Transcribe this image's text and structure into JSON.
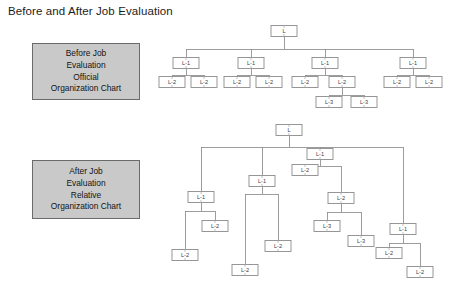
{
  "title": "Before and After Job Evaluation",
  "colors": {
    "caption_fill": "#c9c9c9",
    "caption_border": "#6b6b6b",
    "node_fill": "#ffffff",
    "node_border": "#8c8c8c",
    "edge": "#8c8c8c",
    "background": "#ffffff",
    "text": "#1a1a1a"
  },
  "captions": {
    "before": {
      "lines": [
        "Before Job",
        "Evaluation",
        "Official",
        "Organization Chart"
      ]
    },
    "after": {
      "lines": [
        "After Job",
        "Evaluation",
        "Relative",
        "Organization Chart"
      ]
    }
  },
  "chart_data": {
    "type": "diagram",
    "subtype": "organization-chart-pair",
    "title": "Before and After Job Evaluation",
    "node_size": {
      "width": 26,
      "height": 11
    },
    "level_labels": [
      "L",
      "L-1",
      "L-2",
      "L-3"
    ],
    "charts": [
      {
        "name": "before-job-evaluation-official-organization-chart",
        "caption": [
          "Before Job",
          "Evaluation",
          "Official",
          "Organization Chart"
        ],
        "description": "Official chart: levels are drawn at uniform depths, all L-1 aligned, all L-2 aligned.",
        "counts": {
          "L": 1,
          "L-1": 4,
          "L-2": 8,
          "L-3": 2,
          "total": 15
        },
        "nodes": [
          {
            "id": "b-root",
            "label": "L",
            "cx": 284,
            "cy": 31
          },
          {
            "id": "b1",
            "label": "L-1",
            "cx": 186,
            "cy": 63
          },
          {
            "id": "b2",
            "label": "L-1",
            "cx": 251,
            "cy": 63
          },
          {
            "id": "b3",
            "label": "L-1",
            "cx": 325,
            "cy": 63
          },
          {
            "id": "b4",
            "label": "L-1",
            "cx": 413,
            "cy": 63
          },
          {
            "id": "b1a",
            "label": "L-2",
            "cx": 172,
            "cy": 82
          },
          {
            "id": "b1b",
            "label": "L-2",
            "cx": 204,
            "cy": 82
          },
          {
            "id": "b2a",
            "label": "L-2",
            "cx": 237,
            "cy": 82
          },
          {
            "id": "b2b",
            "label": "L-2",
            "cx": 269,
            "cy": 82
          },
          {
            "id": "b3a",
            "label": "L-2",
            "cx": 305,
            "cy": 82
          },
          {
            "id": "b3b",
            "label": "L-2",
            "cx": 342,
            "cy": 82
          },
          {
            "id": "b4a",
            "label": "L-2",
            "cx": 397,
            "cy": 82
          },
          {
            "id": "b4b",
            "label": "L-2",
            "cx": 429,
            "cy": 82
          },
          {
            "id": "b3b1",
            "label": "L-3",
            "cx": 329,
            "cy": 102
          },
          {
            "id": "b3b2",
            "label": "L-3",
            "cx": 364,
            "cy": 102
          }
        ],
        "edges": [
          {
            "parent": "b-root",
            "children": [
              "b1",
              "b2",
              "b3",
              "b4"
            ],
            "bus_y": 49
          },
          {
            "parent": "b1",
            "children": [
              "b1a",
              "b1b"
            ],
            "bus_y": 75
          },
          {
            "parent": "b2",
            "children": [
              "b2a",
              "b2b"
            ],
            "bus_y": 75
          },
          {
            "parent": "b3",
            "children": [
              "b3a",
              "b3b"
            ],
            "bus_y": 75
          },
          {
            "parent": "b4",
            "children": [
              "b4a",
              "b4b"
            ],
            "bus_y": 75
          },
          {
            "parent": "b3b",
            "children": [
              "b3b1",
              "b3b2"
            ],
            "bus_y": 95
          }
        ]
      },
      {
        "name": "after-job-evaluation-relative-organization-chart",
        "caption": [
          "After Job",
          "Evaluation",
          "Relative",
          "Organization Chart"
        ],
        "description": "Relative chart: same hierarchy but each node is placed at a depth reflecting its evaluated job size, so siblings sit at staggered heights.",
        "counts": {
          "L": 1,
          "L-1": 4,
          "L-2": 8,
          "L-3": 2,
          "total": 15
        },
        "nodes": [
          {
            "id": "a-root",
            "label": "L",
            "cx": 289,
            "cy": 130
          },
          {
            "id": "a1",
            "label": "L-1",
            "cx": 201,
            "cy": 197
          },
          {
            "id": "a2",
            "label": "L-1",
            "cx": 262,
            "cy": 181
          },
          {
            "id": "a3",
            "label": "L-1",
            "cx": 320,
            "cy": 154
          },
          {
            "id": "a4",
            "label": "L-1",
            "cx": 403,
            "cy": 229
          },
          {
            "id": "a1a",
            "label": "L-2",
            "cx": 185,
            "cy": 255
          },
          {
            "id": "a1b",
            "label": "L-2",
            "cx": 215,
            "cy": 226
          },
          {
            "id": "a2a",
            "label": "L-2",
            "cx": 245,
            "cy": 270
          },
          {
            "id": "a2b",
            "label": "L-2",
            "cx": 278,
            "cy": 246
          },
          {
            "id": "a3a",
            "label": "L-2",
            "cx": 305,
            "cy": 170
          },
          {
            "id": "a3b",
            "label": "L-2",
            "cx": 341,
            "cy": 198
          },
          {
            "id": "a4a",
            "label": "L-2",
            "cx": 389,
            "cy": 253
          },
          {
            "id": "a4b",
            "label": "L-2",
            "cx": 420,
            "cy": 272
          },
          {
            "id": "a3b1",
            "label": "L-3",
            "cx": 327,
            "cy": 226
          },
          {
            "id": "a3b2",
            "label": "L-3",
            "cx": 361,
            "cy": 241
          }
        ],
        "edges": [
          {
            "parent": "a-root",
            "children": [
              "a1",
              "a2",
              "a3",
              "a4"
            ],
            "bus_y": 147
          },
          {
            "parent": "a1",
            "children": [
              "a1a",
              "a1b"
            ],
            "bus_y": 211
          },
          {
            "parent": "a2",
            "children": [
              "a2a",
              "a2b"
            ],
            "bus_y": 194
          },
          {
            "parent": "a3",
            "children": [
              "a3a",
              "a3b"
            ],
            "bus_y": 166
          },
          {
            "parent": "a4",
            "children": [
              "a4a",
              "a4b"
            ],
            "bus_y": 243
          },
          {
            "parent": "a3b",
            "children": [
              "a3b1",
              "a3b2"
            ],
            "bus_y": 212
          }
        ]
      }
    ]
  }
}
